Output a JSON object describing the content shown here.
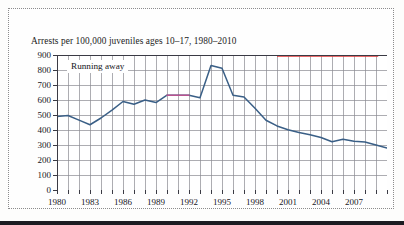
{
  "figure": {
    "title": "Arrests per 100,000 juveniles ages 10–17, 1980–2010",
    "series_label": "Running away",
    "frame_style": "dotted-border"
  },
  "colors": {
    "line": "#3a5f86",
    "line_highlight": "#b8538f",
    "top_rule": "#e03a3a",
    "grid": "#8a8a92",
    "axis": "#3a3a44",
    "text": "#17171d",
    "plot_background": "#ffffff",
    "page_background": "#fdfdfc",
    "bottom_bar": "#1c1c22"
  },
  "axes": {
    "y_ticks": [
      "900",
      "800",
      "700",
      "600",
      "500",
      "400",
      "300",
      "200",
      "100",
      "0"
    ],
    "x_ticks": [
      "1980",
      "1983",
      "1986",
      "1989",
      "1992",
      "1995",
      "1998",
      "2001",
      "2004",
      "2007"
    ]
  },
  "chart_data": {
    "type": "line",
    "title": "Arrests per 100,000 juveniles ages 10–17, 1980–2010",
    "xlabel": "",
    "ylabel": "Arrests per 100,000 juveniles ages 10–17",
    "xlim": [
      1980,
      2010
    ],
    "ylim": [
      0,
      900
    ],
    "y_tick_step": 100,
    "x_tick_step": 3,
    "x_grid_step": 1,
    "grid": true,
    "legend": "inline-label",
    "legend_position": "top-left",
    "x": [
      1980,
      1981,
      1982,
      1983,
      1984,
      1985,
      1986,
      1987,
      1988,
      1989,
      1990,
      1991,
      1992,
      1993,
      1994,
      1995,
      1996,
      1997,
      1998,
      1999,
      2000,
      2001,
      2002,
      2003,
      2004,
      2005,
      2006,
      2007,
      2008,
      2009,
      2010
    ],
    "series": [
      {
        "name": "Running away",
        "values": [
          490,
          497,
          466,
          435,
          480,
          533,
          590,
          572,
          600,
          583,
          632,
          632,
          632,
          615,
          830,
          812,
          632,
          620,
          545,
          465,
          427,
          402,
          383,
          368,
          350,
          322,
          338,
          325,
          320,
          300,
          280
        ],
        "highlight_range": [
          1990,
          1992
        ]
      }
    ],
    "annotations": [
      {
        "text": "Running away",
        "x": 1981.2,
        "y": 860
      }
    ]
  }
}
